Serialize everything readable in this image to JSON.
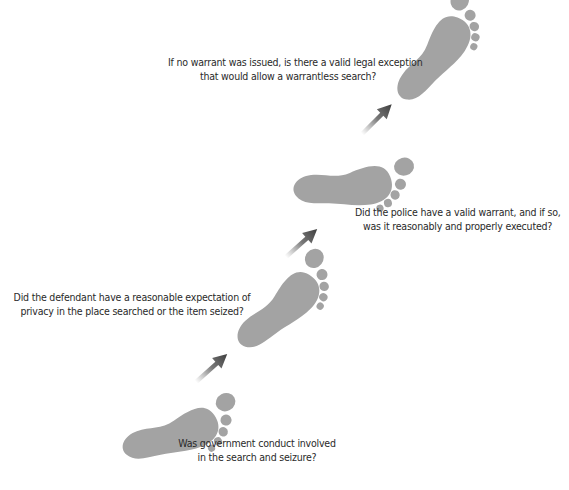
{
  "diagram": {
    "type": "step-flow",
    "motif": "footprints",
    "colors": {
      "footprint": "#a3a3a3",
      "arrow": "#555555",
      "text": "#2a2a2a",
      "background": "#ffffff"
    },
    "steps": [
      {
        "order": 1,
        "line1": "Was government conduct involved",
        "line2": "in the search and seizure?"
      },
      {
        "order": 2,
        "line1": "Did the defendant have a reasonable expectation of",
        "line2": "privacy in the place searched or the item seized?"
      },
      {
        "order": 3,
        "line1": "Did the police have a valid warrant, and if so,",
        "line2": "was it reasonably and properly executed?"
      },
      {
        "order": 4,
        "line1": "If no warrant was issued, is there a valid legal exception",
        "line2": "that would allow a warrantless search?"
      }
    ],
    "arrows": [
      {
        "from": 1,
        "to": 2
      },
      {
        "from": 2,
        "to": 3
      },
      {
        "from": 3,
        "to": 4
      }
    ]
  }
}
